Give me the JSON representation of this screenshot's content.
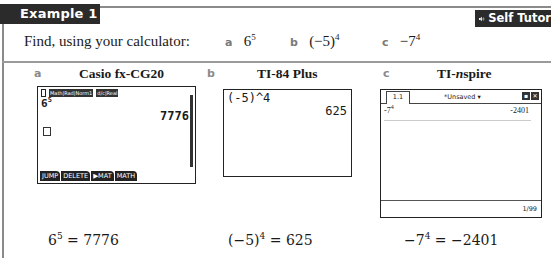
{
  "header": {
    "example_label": "Example 1",
    "self_tutor_label": "Self Tutor",
    "self_tutor_icon": "speaker-icon"
  },
  "question": {
    "prompt": "Find, using your calculator:",
    "parts": [
      {
        "letter": "a",
        "base": "6",
        "exp": "5"
      },
      {
        "letter": "b",
        "base": "(−5)",
        "exp": "4"
      },
      {
        "letter": "c",
        "base": "−7",
        "exp": "4"
      }
    ]
  },
  "sections": [
    {
      "letter": "a",
      "title": "Casio fx-CG20",
      "screen": {
        "status_pills": [
          "Math|Rad|Norm1",
          "d/c|Real"
        ],
        "expr_base": "6",
        "expr_exp": "5",
        "result": "7776",
        "fkeys": [
          "JUMP",
          "DELETE",
          "▶MAT",
          "MATH"
        ]
      },
      "answer": {
        "base": "6",
        "exp": "5",
        "rest": " = 7776"
      }
    },
    {
      "letter": "b",
      "title": "TI-84 Plus",
      "screen": {
        "expr": "(-5)^4",
        "result": "625"
      },
      "answer": {
        "base": "(−5)",
        "exp": "4",
        "rest": " = 625"
      }
    },
    {
      "letter": "c",
      "title_prefix": "TI-",
      "title_italic": "n",
      "title_suffix": "spire",
      "screen": {
        "tab": "1.1",
        "doc_title": "*Unsaved ▾",
        "expr_base": "-7",
        "expr_exp": "4",
        "result": "-2401",
        "count": "1/99"
      },
      "answer": {
        "base": "−7",
        "exp": "4",
        "rest": " = −2401"
      }
    }
  ]
}
